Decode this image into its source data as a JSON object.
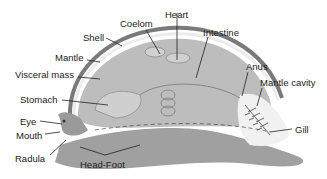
{
  "diagram": {
    "labels": {
      "shell": "Shell",
      "coelom": "Coelom",
      "heart": "Heart",
      "intestine": "Intestine",
      "mantle": "Mantle",
      "visceral_mass": "Visceral mass",
      "anus": "Anus",
      "mantle_cavity": "Mantle cavity",
      "stomach": "Stomach",
      "eye": "Eye",
      "mouth": "Mouth",
      "gill": "Gill",
      "radula": "Radula",
      "head_foot": "Head-Foot"
    },
    "colors": {
      "body": "#a3a3a3",
      "visceral": "#c4c4c4",
      "shell": "#7a7a7a",
      "mantle": "#e6e6e6",
      "line": "#222222"
    }
  }
}
